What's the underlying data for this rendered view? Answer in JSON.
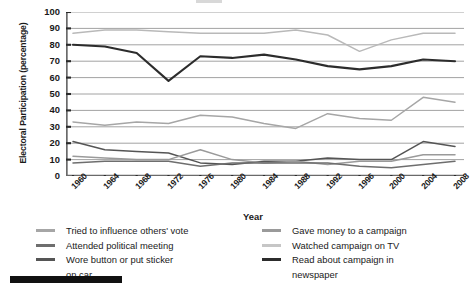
{
  "chart_data": {
    "type": "line",
    "title": "",
    "xlabel": "Year",
    "ylabel": "Electoral Participation (percentage)",
    "ylim": [
      0,
      100
    ],
    "ytick_step": 10,
    "yticks": [
      100,
      90,
      80,
      70,
      60,
      50,
      40,
      30,
      20,
      10,
      0
    ],
    "grid": true,
    "legend_position": "bottom",
    "categories": [
      1960,
      1964,
      1968,
      1972,
      1976,
      1980,
      1984,
      1988,
      1992,
      1996,
      2000,
      2004,
      2008
    ],
    "x_tick_labels": [
      "1960",
      "1964",
      "1968",
      "1972",
      "1976",
      "1980",
      "1984",
      "1988",
      "1992",
      "1996",
      "2000",
      "2004",
      "2008"
    ],
    "series": [
      {
        "name": "Watched campaign on TV",
        "color": "#b9b9b9",
        "values": [
          87,
          89,
          89,
          88,
          87,
          87,
          87,
          89,
          86,
          76,
          83,
          87,
          87
        ]
      },
      {
        "name": "Read about campaign in newspaper",
        "color": "#2c2c2c",
        "values": [
          80,
          79,
          75,
          58,
          73,
          72,
          74,
          71,
          67,
          65,
          67,
          71,
          70
        ]
      },
      {
        "name": "Tried to influence others' vote",
        "color": "#a6a6a6",
        "values": [
          33,
          31,
          33,
          32,
          37,
          36,
          32,
          29,
          38,
          35,
          34,
          48,
          45
        ]
      },
      {
        "name": "Wore button or put sticker on car",
        "color": "#555555",
        "values": [
          21,
          16,
          15,
          14,
          8,
          7,
          9,
          9,
          11,
          10,
          10,
          21,
          18
        ]
      },
      {
        "name": "Gave money to a campaign",
        "color": "#9a9a9a",
        "values": [
          12,
          11,
          10,
          10,
          16,
          10,
          8,
          9,
          7,
          9,
          9,
          13,
          13
        ]
      },
      {
        "name": "Attended political meeting",
        "color": "#6e6e6e",
        "values": [
          8,
          9,
          9,
          9,
          6,
          8,
          8,
          8,
          8,
          6,
          5,
          7,
          9
        ]
      }
    ]
  },
  "axes": {
    "y_title": "Electoral Participation (percentage)",
    "x_title": "Year"
  },
  "legend": {
    "left_column": [
      {
        "label": "Tried to influence others' vote",
        "color": "#a6a6a6"
      },
      {
        "label": "Attended political meeting",
        "color": "#6e6e6e"
      },
      {
        "label": "Wore button or put sticker",
        "color": "#555555",
        "continuation": "on car"
      }
    ],
    "right_column": [
      {
        "label": "Gave money to a campaign",
        "color": "#9a9a9a"
      },
      {
        "label": "Watched campaign on TV",
        "color": "#c6c6c6"
      },
      {
        "label": "Read about campaign in",
        "color": "#2c2c2c",
        "continuation": "newspaper"
      }
    ]
  },
  "colors": {
    "grid": "#8a8a8a",
    "axis": "#6a6a6a",
    "text": "#1a1a1a",
    "bar": "#111111"
  }
}
